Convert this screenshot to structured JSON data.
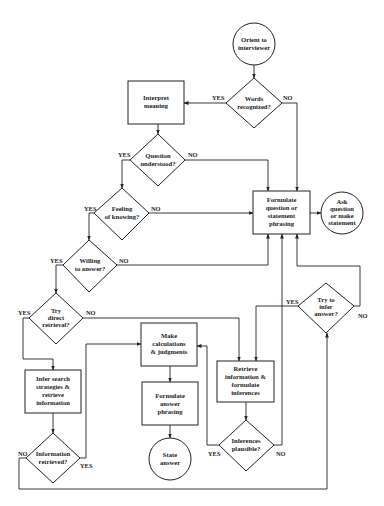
{
  "diagram": {
    "type": "flowchart",
    "colors": {
      "stroke": "#222222",
      "background": "#ffffff",
      "text": "#222222"
    },
    "nodes": {
      "orient": {
        "shape": "circle",
        "lines": [
          "Orient to",
          "interviewer"
        ]
      },
      "words": {
        "shape": "diamond",
        "lines": [
          "Words",
          "recognized?"
        ]
      },
      "interpret": {
        "shape": "box",
        "lines": [
          "Interpret",
          "meaning"
        ]
      },
      "question": {
        "shape": "diamond",
        "lines": [
          "Question",
          "understood?"
        ]
      },
      "feeling": {
        "shape": "diamond",
        "lines": [
          "Feeling",
          "of knowing?"
        ]
      },
      "formulate_q": {
        "shape": "box",
        "lines": [
          "Formulate",
          "question or",
          "statement",
          "phrasing"
        ]
      },
      "ask": {
        "shape": "circle",
        "lines": [
          "Ask",
          "question",
          "or make",
          "statement"
        ]
      },
      "willing": {
        "shape": "diamond",
        "lines": [
          "Willing",
          "to answer?"
        ]
      },
      "try_direct": {
        "shape": "diamond",
        "lines": [
          "Try",
          "direct",
          "retrieval?"
        ]
      },
      "try_infer": {
        "shape": "diamond",
        "lines": [
          "Try to",
          "infer",
          "answer?"
        ]
      },
      "make_calc": {
        "shape": "box",
        "lines": [
          "Make",
          "calculations",
          "& judgments"
        ]
      },
      "retrieve": {
        "shape": "box",
        "lines": [
          "Retrieve",
          "information &",
          "formulate",
          "inferences"
        ]
      },
      "infer_search": {
        "shape": "box",
        "lines": [
          "Infer search",
          "strategies &",
          "retrieve",
          "information"
        ]
      },
      "formulate_a": {
        "shape": "box",
        "lines": [
          "Formulate",
          "answer",
          "phrasing"
        ]
      },
      "info_retrieved": {
        "shape": "diamond",
        "lines": [
          "Information",
          "retrieved?"
        ]
      },
      "inferences_plausible": {
        "shape": "diamond",
        "lines": [
          "Inferences",
          "plausible?"
        ]
      },
      "state": {
        "shape": "circle",
        "lines": [
          "State",
          "answer"
        ]
      }
    },
    "branch_labels": {
      "words_yes": "YES",
      "words_no": "NO",
      "question_yes": "YES",
      "question_no": "NO",
      "feeling_yes": "YES",
      "feeling_no": "NO",
      "willing_yes": "YES",
      "willing_no": "NO",
      "direct_yes": "YES",
      "direct_no": "NO",
      "infer_yes": "YES",
      "infer_no": "NO",
      "retrieved_yes": "YES",
      "retrieved_no": "NO",
      "plausible_yes": "YES",
      "plausible_no": "NO"
    },
    "edges": [
      [
        "orient",
        "words"
      ],
      [
        "words",
        "interpret",
        "YES"
      ],
      [
        "words",
        "formulate_q",
        "NO"
      ],
      [
        "interpret",
        "question"
      ],
      [
        "question",
        "feeling",
        "YES"
      ],
      [
        "question",
        "formulate_q",
        "NO"
      ],
      [
        "feeling",
        "willing",
        "YES"
      ],
      [
        "feeling",
        "formulate_q",
        "NO"
      ],
      [
        "willing",
        "try_direct",
        "YES"
      ],
      [
        "willing",
        "formulate_q",
        "NO"
      ],
      [
        "try_direct",
        "infer_search",
        "YES"
      ],
      [
        "try_direct",
        "retrieve",
        "NO"
      ],
      [
        "formulate_q",
        "ask"
      ],
      [
        "try_infer",
        "retrieve",
        "YES"
      ],
      [
        "try_infer",
        "formulate_q",
        "NO"
      ],
      [
        "infer_search",
        "info_retrieved"
      ],
      [
        "info_retrieved",
        "make_calc",
        "YES"
      ],
      [
        "info_retrieved",
        "try_infer",
        "NO"
      ],
      [
        "retrieve",
        "inferences_plausible"
      ],
      [
        "inferences_plausible",
        "make_calc",
        "YES"
      ],
      [
        "inferences_plausible",
        "formulate_q",
        "NO"
      ],
      [
        "make_calc",
        "formulate_a"
      ],
      [
        "formulate_a",
        "state"
      ]
    ]
  }
}
